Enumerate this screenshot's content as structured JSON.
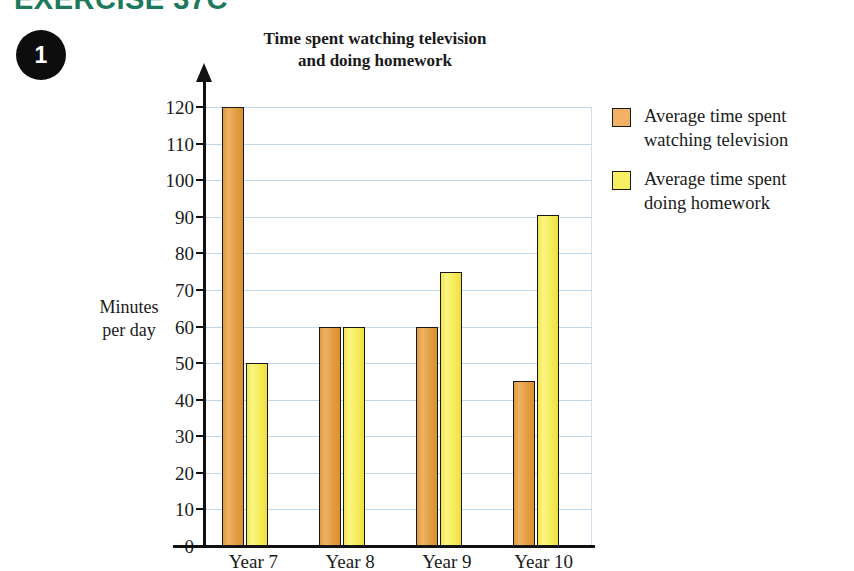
{
  "exercise": {
    "heading": "EXERCISE 37C",
    "question_number": "1"
  },
  "chart_title": {
    "line1": "Time spent watching television",
    "line2": "and doing homework"
  },
  "axis": {
    "y_title_line1": "Minutes",
    "y_title_line2": "per day"
  },
  "legend": {
    "items": [
      {
        "key": "tv",
        "line1": "Average time spent",
        "line2": "watching television",
        "color": "#f2b165"
      },
      {
        "key": "hw",
        "line1": "Average time spent",
        "line2": "doing homework",
        "color": "#f9ef62"
      }
    ]
  },
  "chart_data": {
    "type": "bar",
    "title": "Time spent watching television and doing homework",
    "xlabel": "",
    "ylabel": "Minutes per day",
    "ylim": [
      0,
      120
    ],
    "yticks": [
      0,
      10,
      20,
      30,
      40,
      50,
      60,
      70,
      80,
      90,
      100,
      110,
      120
    ],
    "ytick_labels": [
      "0",
      "10",
      "20",
      "30",
      "40",
      "50",
      "60",
      "70",
      "80",
      "90",
      "100",
      "110",
      "120"
    ],
    "grid": true,
    "legend_position": "right",
    "categories": [
      "Year 7",
      "Year 8",
      "Year 9",
      "Year 10"
    ],
    "series": [
      {
        "name": "Average time spent watching television",
        "color": "#e4a04a",
        "values": [
          120,
          60,
          60,
          45
        ]
      },
      {
        "name": "Average time spent doing homework",
        "color": "#f6ec5c",
        "values": [
          50,
          60,
          75,
          90.5
        ]
      }
    ]
  }
}
